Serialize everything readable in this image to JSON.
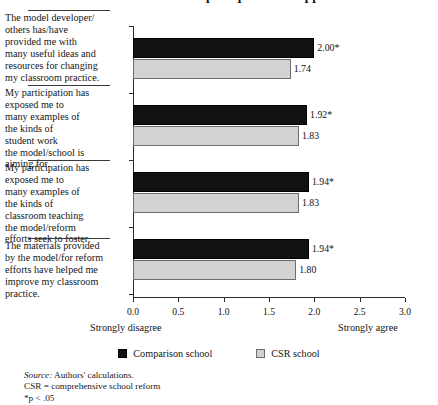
{
  "figure": {
    "title_fragment": "teachers' perceptions of support",
    "source_note_label": "Source:",
    "source_note_text": " Authors' calculations.",
    "abbrev_note": "CSR  =  comprehensive school reform",
    "significance_note": "*p < .05"
  },
  "legend": {
    "items": [
      {
        "label": "Comparison school",
        "color": "#111111",
        "swatch": "dark"
      },
      {
        "label": "CSR school",
        "color": "#d2d2d2",
        "swatch": "light"
      }
    ]
  },
  "anchors": {
    "left": "Strongly disagree",
    "right": "Strongly agree"
  },
  "chart_data": {
    "type": "bar",
    "orientation": "horizontal",
    "title": "teachers' perceptions of support",
    "xlabel": "",
    "ylabel": "",
    "xlim": [
      0.0,
      3.0
    ],
    "xticks": [
      "0.0",
      "0.5",
      "1.0",
      "1.5",
      "2.0",
      "2.5",
      "3.0"
    ],
    "xtick_values": [
      0.0,
      0.5,
      1.0,
      1.5,
      2.0,
      2.5,
      3.0
    ],
    "grid": false,
    "legend_position": "bottom-center",
    "scale_anchor_low": "Strongly disagree",
    "scale_anchor_high": "Strongly agree",
    "categories": [
      "The model developer/ others has/have provided me with many useful ideas and resources for changing my classroom practice.",
      "My participation has exposed me to many examples of the kinds of student work the model/school is aiming for.",
      "My participation has exposed me to many examples of the kinds of classroom teaching the model/reform efforts seek to foster.",
      "The materials provided by the model/for reform efforts have helped me improve my classroom practice."
    ],
    "category_lines": [
      [
        "The model developer/",
        "others has/have",
        "provided me with",
        "many useful ideas and",
        "resources for changing",
        "my classroom practice."
      ],
      [
        "My participation has",
        "exposed me to",
        "many examples of",
        "the kinds of",
        "student work",
        "the model/school is",
        "aiming for."
      ],
      [
        "My participation has",
        "exposed me to",
        "many examples of",
        "the kinds of",
        "classroom teaching",
        "the model/reform",
        "efforts seek to foster."
      ],
      [
        "The materials provided",
        "by the model/for reform",
        "efforts have helped me",
        "improve my classroom",
        "practice."
      ]
    ],
    "series": [
      {
        "name": "Comparison school",
        "color": "#111111",
        "values": [
          2.0,
          1.92,
          1.94,
          1.94
        ],
        "labels": [
          "2.00*",
          "1.92*",
          "1.94*",
          "1.94*"
        ]
      },
      {
        "name": "CSR school",
        "color": "#d2d2d2",
        "values": [
          1.74,
          1.83,
          1.83,
          1.8
        ],
        "labels": [
          "1.74",
          "1.83",
          "1.83",
          "1.80"
        ]
      }
    ]
  }
}
